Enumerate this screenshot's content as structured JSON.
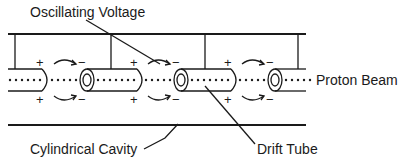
{
  "labels": {
    "oscillating_voltage": "Oscillating Voltage",
    "proton_beam": "Proton Beam",
    "cylindrical_cavity": "Cylindrical Cavity",
    "drift_tube": "Drift Tube"
  },
  "signs": {
    "plus": "+",
    "minus": "−"
  },
  "colors": {
    "line": "#1a1a1a",
    "background": "#ffffff"
  }
}
